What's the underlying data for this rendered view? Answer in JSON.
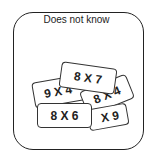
{
  "title": "Does not know",
  "cards": [
    {
      "label": "9 X 4"
    },
    {
      "label": "8 X 4"
    },
    {
      "label": "X 9"
    },
    {
      "label": "8 X 7"
    },
    {
      "label": "8 X 6"
    }
  ]
}
